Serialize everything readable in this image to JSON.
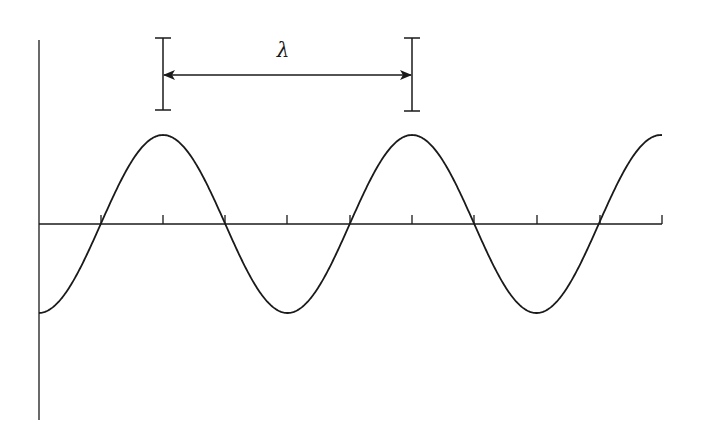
{
  "diagram": {
    "label": "λ",
    "label_meaning": "wavelength",
    "colors": {
      "stroke": "#1a1a1a",
      "background": "#ffffff"
    },
    "axes": {
      "origin_x": 39,
      "baseline_y": 224,
      "x_end": 662,
      "y_top": 40,
      "y_bottom": 420,
      "tick_positions_x": [
        101,
        163,
        225,
        287,
        350,
        412,
        474,
        537,
        600,
        662
      ],
      "tick_height": 9
    },
    "wave": {
      "type": "cosine",
      "amplitude_px": 89,
      "period_px": 249,
      "first_peak_x": 163,
      "start_x": 39,
      "end_x": 662
    },
    "wavelength_marker": {
      "left_x": 163,
      "right_x": 412,
      "bracket_top_y": 38,
      "bracket_bottom_y": 110,
      "arrow_y": 75,
      "label_x": 283,
      "label_y": 57
    }
  }
}
